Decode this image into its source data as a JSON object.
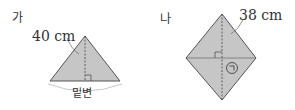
{
  "figures": [
    {
      "id": "ga",
      "label": "가",
      "shape": "isosceles-triangle",
      "measure": "40 cm",
      "base_label": "밑변"
    },
    {
      "id": "na",
      "label": "나",
      "shape": "rhombus",
      "measure": "38 cm",
      "marker": "㉠"
    }
  ],
  "colors": {
    "fill": "#c6c6c6",
    "stroke": "#555555",
    "text": "#333333"
  }
}
